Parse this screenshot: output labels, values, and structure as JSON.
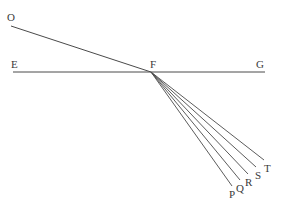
{
  "diagram": {
    "type": "geometric-ray-diagram",
    "labels": {
      "O": "O",
      "E": "E",
      "F": "F",
      "G": "G",
      "P": "P",
      "Q": "Q",
      "R": "R",
      "S": "S",
      "T": "T"
    },
    "points": {
      "O": [
        11,
        26
      ],
      "E": [
        13,
        72
      ],
      "F": [
        151,
        72
      ],
      "G": [
        265,
        72
      ],
      "P": [
        232,
        186
      ],
      "Q": [
        240,
        180
      ],
      "R": [
        248,
        174
      ],
      "S": [
        256,
        167
      ],
      "T": [
        264,
        160
      ]
    },
    "segments": [
      [
        "O",
        "F"
      ],
      [
        "E",
        "G"
      ],
      [
        "F",
        "P"
      ],
      [
        "F",
        "Q"
      ],
      [
        "F",
        "R"
      ],
      [
        "F",
        "S"
      ],
      [
        "F",
        "T"
      ]
    ],
    "line_color": "#4a4a4a",
    "label_color": "#3a3a3a",
    "background": "#ffffff"
  }
}
